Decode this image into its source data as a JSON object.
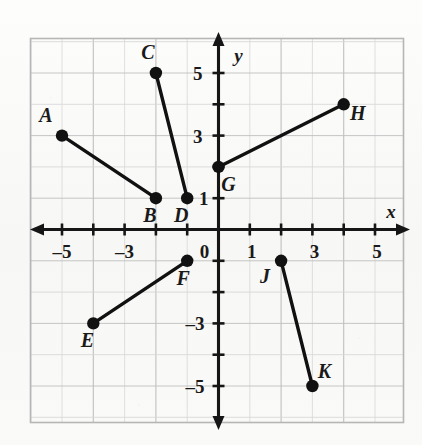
{
  "figure": {
    "axis_labels": {
      "x": "x",
      "y": "y"
    },
    "colors": {
      "grid_minor": "#d8d8d8",
      "grid_major": "#c0c0c0",
      "axis": "#161616",
      "point": "#111111",
      "segment": "#111111",
      "paper": "#f8f8f6"
    }
  },
  "chart_data": {
    "type": "scatter",
    "title": "",
    "xlabel": "x",
    "ylabel": "y",
    "xlim": [
      -6,
      6
    ],
    "ylim": [
      -6,
      6
    ],
    "grid": true,
    "legend": "none",
    "x_ticks": [
      -5,
      -3,
      0,
      1,
      3,
      5
    ],
    "y_ticks": [
      5,
      3,
      1,
      0,
      -3,
      -5
    ],
    "x_tick_labels": [
      "–5",
      "–3",
      "0",
      "1",
      "3",
      "5"
    ],
    "y_tick_labels": [
      "5",
      "3",
      "1",
      "0",
      "–3",
      "–5"
    ],
    "points": [
      {
        "name": "A",
        "x": -5,
        "y": 3,
        "label_dx": -16,
        "label_dy": -14
      },
      {
        "name": "B",
        "x": -2,
        "y": 1,
        "label_dx": -6,
        "label_dy": 24
      },
      {
        "name": "C",
        "x": -2,
        "y": 5,
        "label_dx": -8,
        "label_dy": -14
      },
      {
        "name": "D",
        "x": -1,
        "y": 1,
        "label_dx": -6,
        "label_dy": 24
      },
      {
        "name": "E",
        "x": -4,
        "y": -3,
        "label_dx": -6,
        "label_dy": 24
      },
      {
        "name": "F",
        "x": -1,
        "y": -1,
        "label_dx": -4,
        "label_dy": 24
      },
      {
        "name": "G",
        "x": 0,
        "y": 2,
        "label_dx": 10,
        "label_dy": 24
      },
      {
        "name": "H",
        "x": 4,
        "y": 4,
        "label_dx": 14,
        "label_dy": 16
      },
      {
        "name": "J",
        "x": 2,
        "y": -1,
        "label_dx": -16,
        "label_dy": 22
      },
      {
        "name": "K",
        "x": 3,
        "y": -5,
        "label_dx": 12,
        "label_dy": -8
      }
    ],
    "segments": [
      {
        "name": "AB",
        "from": "A",
        "to": "B"
      },
      {
        "name": "CD",
        "from": "C",
        "to": "D"
      },
      {
        "name": "EF",
        "from": "E",
        "to": "F"
      },
      {
        "name": "GH",
        "from": "G",
        "to": "H"
      },
      {
        "name": "JK",
        "from": "J",
        "to": "K"
      }
    ]
  }
}
